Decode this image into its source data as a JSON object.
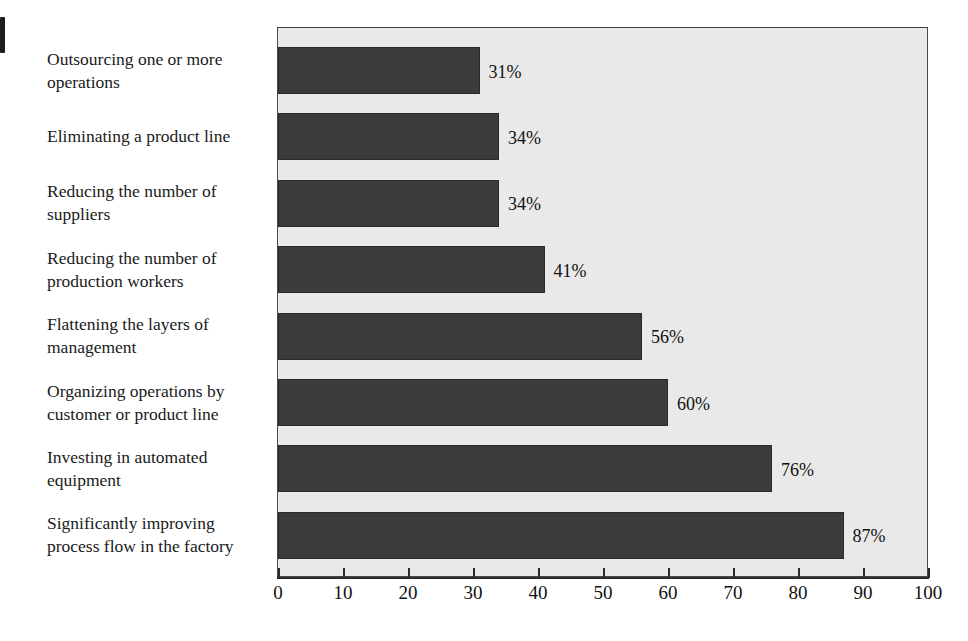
{
  "chart_data": {
    "type": "bar",
    "orientation": "horizontal",
    "title": "",
    "subtitle": "",
    "xlabel": "",
    "ylabel": "",
    "xlim": [
      0,
      100
    ],
    "xticks": [
      0,
      10,
      20,
      30,
      40,
      50,
      60,
      70,
      80,
      90,
      100
    ],
    "xtick_labels": [
      "0",
      "10",
      "20",
      "30",
      "40",
      "50",
      "60",
      "70",
      "80",
      "90",
      "100"
    ],
    "grid": false,
    "legend": null,
    "value_label_suffix": "%",
    "categories": [
      "Outsourcing one or more operations",
      "Eliminating a product line",
      "Reducing the number of suppliers",
      "Reducing the number of production workers",
      "Flattening the layers of management",
      "Organizing operations by customer or product line",
      "Investing in automated equipment",
      "Significantly improving process flow in the factory"
    ],
    "values": [
      31,
      34,
      34,
      41,
      56,
      60,
      76,
      87
    ],
    "value_labels": [
      "31%",
      "34%",
      "34%",
      "41%",
      "56%",
      "60%",
      "76%",
      "87%"
    ],
    "colors": {
      "bar_fill": "#3b3b3b",
      "bar_edge": "#2a2a2a",
      "plot_background": "#e9e9e9",
      "page_background": "#ffffff",
      "axis": "#2b2b2b",
      "text": "#111111"
    }
  },
  "labels": {
    "lines": [
      [
        "Outsourcing one or more",
        "operations"
      ],
      [
        "Eliminating a product line"
      ],
      [
        "Reducing the number of",
        "suppliers"
      ],
      [
        "Reducing the number of",
        "production workers"
      ],
      [
        "Flattening the layers of",
        "management"
      ],
      [
        "Organizing operations by",
        "customer or product line"
      ],
      [
        "Investing in automated",
        "equipment"
      ],
      [
        "Significantly improving",
        "process flow in the factory"
      ]
    ]
  }
}
